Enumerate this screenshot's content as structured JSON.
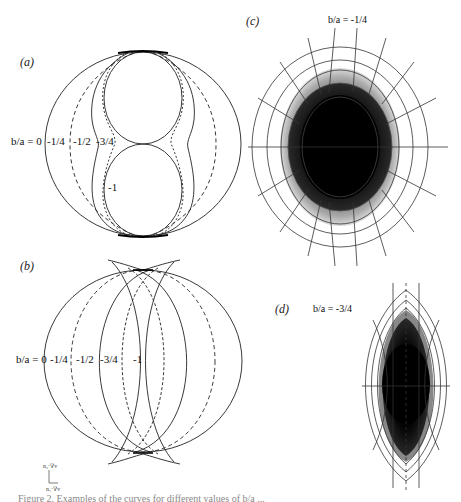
{
  "figure": {
    "panels": [
      {
        "id": "a",
        "tag": "(a)",
        "description": "Curves for different b/a ratios (figure-eight at b/a=-1)",
        "labels": {
          "prefix": "b/a = 0",
          "v1": "-1/4",
          "v2": "-1/2",
          "v3": "-3/4",
          "v4": "-1"
        }
      },
      {
        "id": "b",
        "tag": "(b)",
        "description": "Intersecting arcs with cusps for different b/a ratios",
        "labels": {
          "prefix": "b/a = 0",
          "v1": "-1/4",
          "v2": "-1/2",
          "v3": "-3/4",
          "v4": "-1"
        }
      },
      {
        "id": "c",
        "tag": "(c)",
        "title": "b/a = -1/4"
      },
      {
        "id": "d",
        "tag": "(d)",
        "title": "b/a = -3/4"
      }
    ],
    "axis_indicator": {
      "vertical": "n₂·∇v",
      "horizontal": "n₁·∇v"
    },
    "caption": "Figure 2.  Examples of the curves for different values of b/a ..."
  }
}
